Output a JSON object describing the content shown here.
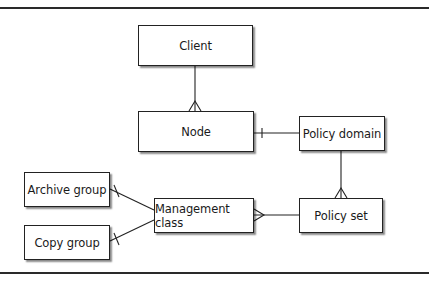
{
  "diagram": {
    "type": "entity-relationship",
    "entities": [
      {
        "id": "client",
        "label": "Client"
      },
      {
        "id": "node",
        "label": "Node"
      },
      {
        "id": "policy_domain",
        "label": "Policy domain"
      },
      {
        "id": "policy_set",
        "label": "Policy set"
      },
      {
        "id": "management_class",
        "label": "Management class"
      },
      {
        "id": "archive_group",
        "label": "Archive group"
      },
      {
        "id": "copy_group",
        "label": "Copy group"
      }
    ],
    "relationships": [
      {
        "from": "client",
        "to": "node",
        "from_end": "one",
        "to_end": "many"
      },
      {
        "from": "policy_domain",
        "to": "node",
        "from_end": "one",
        "to_end": "one"
      },
      {
        "from": "policy_domain",
        "to": "policy_set",
        "from_end": "one",
        "to_end": "many"
      },
      {
        "from": "policy_set",
        "to": "management_class",
        "from_end": "one",
        "to_end": "many"
      },
      {
        "from": "management_class",
        "to": "archive_group",
        "from_end": "one",
        "to_end": "one"
      },
      {
        "from": "management_class",
        "to": "copy_group",
        "from_end": "one",
        "to_end": "one"
      }
    ]
  }
}
